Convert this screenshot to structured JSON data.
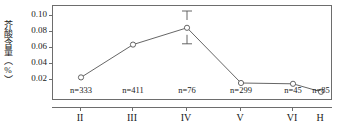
{
  "chart_data": {
    "type": "line",
    "title": "",
    "xlabel": "",
    "ylabel": "芥酸含量（%）",
    "categories": [
      "II",
      "III",
      "IV",
      "V",
      "VI",
      "H"
    ],
    "values": [
      0.022,
      0.063,
      0.084,
      0.015,
      0.014,
      0.004
    ],
    "errors": [
      {
        "category": "IV",
        "upper": 0.105,
        "lower": 0.064
      }
    ],
    "point_labels": [
      "n=333",
      "n=411",
      "n=76",
      "n=299",
      "n=45",
      "n=85"
    ],
    "sample_sizes": [
      333,
      411,
      76,
      299,
      45,
      85
    ],
    "ylim": [
      0.0,
      0.11
    ],
    "yticks": [
      "0.02",
      "0.04",
      "0.06",
      "0.08",
      "0.10"
    ],
    "ytick_values": [
      0.02,
      0.04,
      0.06,
      0.08,
      0.1
    ],
    "grid": false,
    "legend": "none",
    "marker": "open-circle",
    "line_color": "#555555",
    "marker_color": "#555555",
    "axis_color": "#6d6d6d"
  },
  "axes": {
    "y_title": "芥酸含量（%）",
    "y_tick_labels": [
      "0.10",
      "0.08",
      "0.06",
      "0.04",
      "0.02"
    ],
    "x_tick_labels": [
      "II",
      "III",
      "IV",
      "V",
      "VI",
      "H"
    ]
  },
  "annotations": {
    "n_labels": [
      "n=333",
      "n=411",
      "n=76",
      "n=299",
      "n=45",
      "n=85"
    ],
    "n_prefix": "n",
    "n_equals": "="
  }
}
